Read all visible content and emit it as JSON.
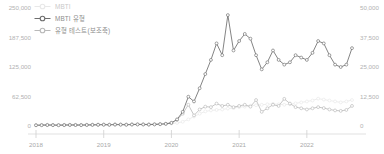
{
  "legend": {
    "position": "top-left",
    "items": [
      {
        "label": "MBTI",
        "color": "#e8e8e8",
        "marker": "open-circle-icon",
        "axis": "left"
      },
      {
        "label": "MBTI 유형",
        "color": "#6e6e6e",
        "marker": "open-circle-icon",
        "axis": "left"
      },
      {
        "label": "유형 테스트(보조축)",
        "color": "#b9b9b9",
        "marker": "open-circle-icon",
        "axis": "right"
      }
    ]
  },
  "axes": {
    "left_ticks": [
      "250,000",
      "187,500",
      "125,000",
      "62,500",
      "0"
    ],
    "right_ticks": [
      "50,000",
      "37,500",
      "25,000",
      "12,500",
      "0"
    ],
    "x_ticks": [
      "2018",
      "2019",
      "2020",
      "2021",
      "2022"
    ]
  },
  "caption": "",
  "chart_data": {
    "type": "line",
    "title": "",
    "xlabel": "",
    "ylabel": "",
    "y2label": "",
    "ylim": [
      0,
      250000
    ],
    "y2lim": [
      0,
      50000
    ],
    "grid": false,
    "legend_position": "top-left",
    "xtick_labels": [
      "2018",
      "2019",
      "2020",
      "2021",
      "2022"
    ],
    "ytick_labels": [
      "0",
      "62,500",
      "125,000",
      "187,500",
      "250,000"
    ],
    "y2tick_labels": [
      "0",
      "12,500",
      "25,000",
      "37,500",
      "50,000"
    ],
    "x": [
      "2018-01",
      "2018-02",
      "2018-03",
      "2018-04",
      "2018-05",
      "2018-06",
      "2018-07",
      "2018-08",
      "2018-09",
      "2018-10",
      "2018-11",
      "2018-12",
      "2019-01",
      "2019-02",
      "2019-03",
      "2019-04",
      "2019-05",
      "2019-06",
      "2019-07",
      "2019-08",
      "2019-09",
      "2019-10",
      "2019-11",
      "2019-12",
      "2020-01",
      "2020-02",
      "2020-03",
      "2020-04",
      "2020-05",
      "2020-06",
      "2020-07",
      "2020-08",
      "2020-09",
      "2020-10",
      "2020-11",
      "2020-12",
      "2021-01",
      "2021-02",
      "2021-03",
      "2021-04",
      "2021-05",
      "2021-06",
      "2021-07",
      "2021-08",
      "2021-09",
      "2021-10",
      "2021-11",
      "2021-12",
      "2022-01",
      "2022-02",
      "2022-03",
      "2022-04",
      "2022-05",
      "2022-06",
      "2022-07",
      "2022-08",
      "2022-09"
    ],
    "series": [
      {
        "name": "MBTI",
        "axis": "left",
        "color": "#e8e8e8",
        "values": [
          2000,
          2200,
          2500,
          2300,
          2100,
          2400,
          2600,
          2500,
          2300,
          2600,
          2800,
          3000,
          3200,
          3000,
          3400,
          3300,
          3100,
          3500,
          3700,
          3600,
          3400,
          3800,
          4200,
          4600,
          5200,
          6500,
          9000,
          14000,
          20000,
          26000,
          31000,
          33000,
          34000,
          35000,
          37000,
          38000,
          40000,
          41000,
          43000,
          44000,
          45000,
          46000,
          47000,
          46000,
          45000,
          46000,
          48000,
          50000,
          52000,
          54000,
          58000,
          56000,
          54000,
          52000,
          50000,
          52000,
          55000
        ]
      },
      {
        "name": "MBTI 유형",
        "axis": "left",
        "color": "#6e6e6e",
        "values": [
          1500,
          1700,
          2000,
          1800,
          1600,
          1900,
          2100,
          2000,
          1800,
          2100,
          2300,
          2500,
          2700,
          2500,
          2900,
          2800,
          2600,
          3000,
          3200,
          3100,
          2900,
          3300,
          3800,
          4500,
          6500,
          14000,
          30000,
          62000,
          52000,
          80000,
          110000,
          140000,
          175000,
          150000,
          235000,
          160000,
          180000,
          195000,
          185000,
          150000,
          120000,
          135000,
          160000,
          140000,
          130000,
          135000,
          150000,
          145000,
          140000,
          155000,
          180000,
          175000,
          150000,
          130000,
          125000,
          130000,
          165000
        ]
      },
      {
        "name": "유형 테스트(보조축)",
        "axis": "right",
        "color": "#b9b9b9",
        "values": [
          400,
          450,
          500,
          460,
          420,
          480,
          520,
          500,
          460,
          520,
          560,
          600,
          640,
          600,
          680,
          660,
          620,
          700,
          740,
          720,
          680,
          760,
          860,
          980,
          1400,
          2600,
          5200,
          9000,
          4500,
          7000,
          8200,
          8000,
          9500,
          8500,
          9000,
          8000,
          8500,
          9000,
          8200,
          11000,
          6000,
          7500,
          9000,
          8500,
          11500,
          9500,
          8000,
          7500,
          7000,
          7500,
          8000,
          7600,
          7000,
          6600,
          6400,
          6800,
          8500
        ]
      }
    ]
  }
}
